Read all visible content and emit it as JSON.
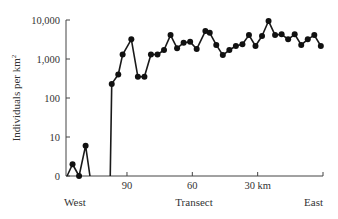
{
  "chart_data": {
    "type": "line",
    "title": "",
    "xlabel": "Transect",
    "ylabel": "Individuals per km²",
    "y_scale": "log",
    "y_ticks": [
      "0",
      "10",
      "100",
      "1,000",
      "10,000"
    ],
    "y_tick_values": [
      1,
      10,
      100,
      1000,
      10000
    ],
    "x_ticks": [
      "90",
      "60",
      "30 km"
    ],
    "x_tick_values": [
      90,
      60,
      30
    ],
    "x_range_km": [
      118,
      0
    ],
    "x_direction_labels": {
      "left": "West",
      "right": "East"
    },
    "grid": false,
    "legend": null,
    "segments": [
      {
        "name": "west-segment",
        "x": [
          115,
          112,
          109
        ],
        "values": [
          2,
          0,
          6
        ]
      },
      {
        "name": "main-segment",
        "x": [
          97,
          94,
          92,
          88,
          85,
          82,
          79,
          76,
          73,
          70,
          67,
          64,
          61,
          58,
          54,
          52,
          49,
          46,
          43,
          40,
          37,
          34,
          31,
          28,
          25,
          22,
          19,
          16,
          13,
          10,
          7,
          4,
          1
        ],
        "values": [
          230,
          400,
          1300,
          3200,
          350,
          350,
          1300,
          1300,
          1700,
          4100,
          1900,
          2600,
          2750,
          1800,
          5200,
          4700,
          2300,
          1260,
          1700,
          2150,
          2400,
          4100,
          2150,
          3900,
          9400,
          4100,
          4300,
          3200,
          4300,
          2300,
          3200,
          4100,
          2150
        ]
      }
    ]
  },
  "labels": {
    "ylabel": "Individuals per km",
    "ylabel_sup": "2",
    "xlabel": "Transect",
    "west": "West",
    "east": "East"
  },
  "style": {
    "line_color": "#1a1a1a",
    "marker_color": "#111111",
    "axis_color": "#444444"
  }
}
